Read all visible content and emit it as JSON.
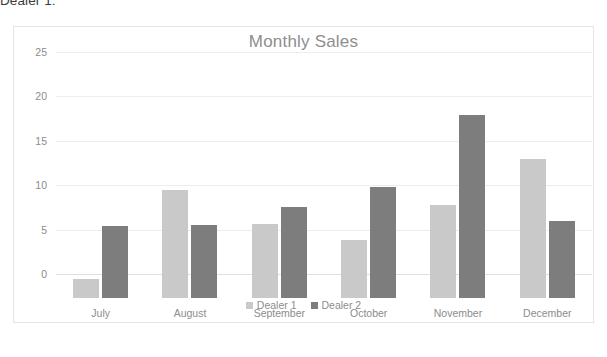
{
  "document": {
    "text_above_chart": "Dealer 1:"
  },
  "chart_data": {
    "type": "bar",
    "title": "Monthly Sales",
    "xlabel": "",
    "ylabel": "",
    "ylim": [
      0,
      25
    ],
    "yticks": [
      0,
      5,
      10,
      15,
      20,
      25
    ],
    "grid": true,
    "legend_position": "bottom",
    "categories": [
      "July",
      "August",
      "September",
      "October",
      "November",
      "December"
    ],
    "series": [
      {
        "name": "Dealer 1",
        "color": "#c9c9c9",
        "values": [
          2.1,
          12.2,
          8.3,
          6.5,
          10.5,
          15.7
        ]
      },
      {
        "name": "Dealer 2",
        "color": "#7d7d7d",
        "values": [
          8.1,
          8.2,
          10.3,
          12.5,
          20.6,
          8.7
        ]
      }
    ]
  }
}
